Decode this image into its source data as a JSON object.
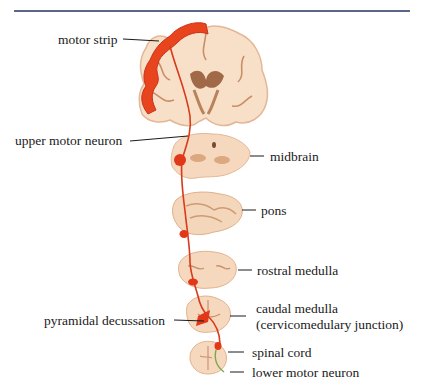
{
  "figure": {
    "type": "neuroanatomy-diagram",
    "colors": {
      "rule": "#5c6688",
      "tissue": "#f6dcc4",
      "tissue_shadow": "#d9a884",
      "tract": "#d83a1a",
      "motor_strip": "#e8441e",
      "lower_motor_neuron": "#7aa84a",
      "leader_line": "#1a1a1a"
    },
    "labels": {
      "motor_strip": "motor strip",
      "upper_motor_neuron": "upper motor neuron",
      "midbrain": "midbrain",
      "pons": "pons",
      "rostral_medulla": "rostral medulla",
      "pyramidal_decussation": "pyramidal decussation",
      "caudal_medulla": "caudal medulla",
      "cervicomedullary_junction": "(cervicomedulary junction)",
      "spinal_cord": "spinal cord",
      "lower_motor_neuron": "lower motor neuron"
    },
    "sections": [
      {
        "name": "coronal-cerebrum"
      },
      {
        "name": "midbrain"
      },
      {
        "name": "pons"
      },
      {
        "name": "rostral medulla"
      },
      {
        "name": "caudal medulla"
      },
      {
        "name": "spinal cord"
      }
    ]
  }
}
